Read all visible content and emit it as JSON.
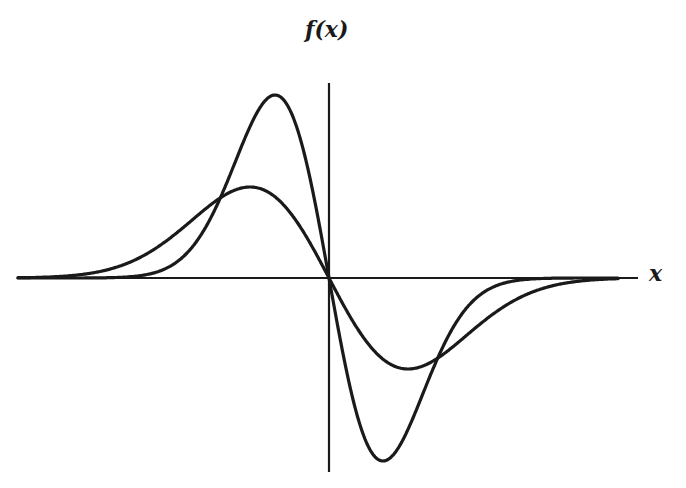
{
  "chart_data": {
    "type": "line",
    "title": "",
    "xlabel": "x",
    "ylabel": "f(x)",
    "grid": false,
    "legend": null,
    "ticks": {
      "x": [],
      "y": []
    },
    "pixel_frame": {
      "origin": [
        329,
        278
      ],
      "x_axis": {
        "x_start": 18,
        "x_end": 638,
        "y": 278
      },
      "y_axis": {
        "x": 329,
        "y_start": 83,
        "y_end": 472
      }
    },
    "xlim": [
      -5.8,
      5.6
    ],
    "ylim": [
      -3.4,
      3.6
    ],
    "series": [
      {
        "name": "narrow curve",
        "formula": "f(x) = -A*x*exp(-x^2/(2*s^2))",
        "amplitude_px": 183,
        "sigma_px": 54,
        "extrema": [
          {
            "x": -1.0,
            "y": 1.0,
            "pixel": [
              275,
              95
            ]
          },
          {
            "x": 1.0,
            "y": -1.0,
            "pixel": [
              383,
              462
            ]
          }
        ]
      },
      {
        "name": "wide curve",
        "formula": "f(x) = -A*x*exp(-x^2/(2*s^2))",
        "amplitude_px": 91,
        "sigma_px": 79,
        "extrema": [
          {
            "x": -1.46,
            "y": 0.5,
            "pixel": [
              250,
              187
            ]
          },
          {
            "x": 1.46,
            "y": -0.5,
            "pixel": [
              408,
              369
            ]
          }
        ]
      }
    ],
    "intersections": [
      {
        "pixel": [
          216,
          204
        ]
      },
      {
        "pixel": [
          329,
          278
        ]
      },
      {
        "pixel": [
          437,
          350
        ]
      }
    ],
    "style": {
      "line_color": "#1a1a1a",
      "line_width": 3,
      "background": "#ffffff"
    }
  },
  "labels": {
    "x": "x",
    "y": "f(x)"
  }
}
